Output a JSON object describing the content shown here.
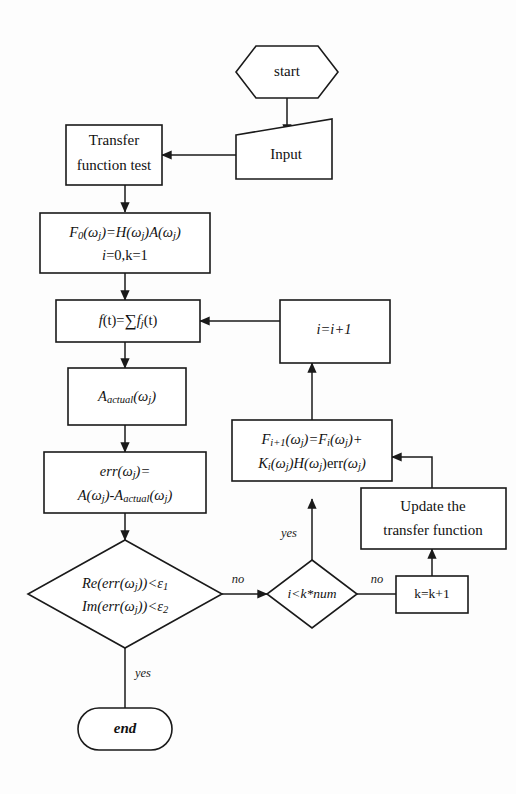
{
  "diagram": {
    "background_color": "#fdfdfd",
    "line_color": "#1a1a1a",
    "shape_fill": "#ffffff",
    "nodes": {
      "start": {
        "label": "start",
        "shape": "hexagon"
      },
      "input": {
        "label": "Input",
        "shape": "parallelogram"
      },
      "transfer_test": {
        "line1": "Transfer",
        "line2": "function test",
        "shape": "rectangle"
      },
      "init": {
        "line1": "F0(ωj)=H(ωj)A(ωj)",
        "line2": "i=0,k=1",
        "shape": "rectangle"
      },
      "sum": {
        "label": "f(t)=∑fj(t)",
        "shape": "rectangle"
      },
      "a_actual": {
        "label": "Aactual(ωj)",
        "shape": "rectangle"
      },
      "err": {
        "line1": "err(ωj)=",
        "line2": "A(ωj)-Aactual(ωj)",
        "shape": "rectangle"
      },
      "check_err": {
        "line1": "Re(err(ωj))<ε1",
        "line2": "Im(err(ωj))<ε2",
        "shape": "diamond"
      },
      "check_iter": {
        "label": "i<k*num",
        "shape": "diamond"
      },
      "k_incr": {
        "label": "k=k+1",
        "shape": "rectangle"
      },
      "update_tf": {
        "line1": "Update the",
        "line2": "transfer function",
        "shape": "rectangle"
      },
      "f_update": {
        "line1": "Fi+1(ωj)=Fi(ωj)+",
        "line2": "Ki(ωj)H(ωj)err(ωj)",
        "shape": "rectangle"
      },
      "i_incr": {
        "label": "i=i+1",
        "shape": "rectangle"
      },
      "end": {
        "label": "end",
        "shape": "stadium"
      }
    },
    "edge_labels": {
      "err_no": "no",
      "err_yes": "yes",
      "iter_no": "no",
      "iter_yes": "yes"
    }
  }
}
